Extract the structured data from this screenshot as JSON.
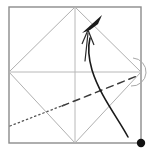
{
  "figure": {
    "kind": "origami-fold-diagram",
    "canvas": {
      "width": 150,
      "height": 154,
      "background": "#ffffff"
    }
  },
  "colors": {
    "frame": "#8c8c8c",
    "crease": "#b0b0b0",
    "crease_light": "#c4c4c4",
    "fold_line": "#3a3a3a",
    "arrow": "#1a1a1a",
    "dot": "#111111",
    "arc": "#a8a8a8"
  },
  "frame": {
    "name": "paper-square-border",
    "x": 9,
    "y": 7,
    "width": 132,
    "height": 136,
    "stroke_width": 1.4
  },
  "crease_lines": [
    {
      "name": "crease-vertical-center",
      "type": "mountain-existing",
      "points": "75,7 75,143",
      "stroke": "#b8b8b8",
      "stroke_width": 1
    },
    {
      "name": "crease-horizontal-center",
      "type": "mountain-existing",
      "points": "9,72 141,72",
      "stroke": "#b8b8b8",
      "stroke_width": 1
    },
    {
      "name": "crease-diamond-top-left",
      "type": "existing-fold",
      "points": "9,72 75,7",
      "stroke": "#b0b0b0",
      "stroke_width": 1
    },
    {
      "name": "crease-diamond-top-right",
      "type": "existing-fold",
      "points": "75,7 141,72",
      "stroke": "#b0b0b0",
      "stroke_width": 1
    },
    {
      "name": "crease-diamond-bottom-left",
      "type": "existing-fold",
      "points": "9,72 75,143",
      "stroke": "#b0b0b0",
      "stroke_width": 1
    },
    {
      "name": "crease-diamond-bottom-right",
      "type": "existing-fold",
      "points": "75,143 141,72",
      "stroke": "#b0b0b0",
      "stroke_width": 1
    }
  ],
  "fold_lines": [
    {
      "name": "valley-fold-dashed-line",
      "type": "valley-fold",
      "style": "dashed",
      "points": "62,106 137,76",
      "stroke": "#3a3a3a",
      "stroke_width": 1.5,
      "dash": "7 5"
    },
    {
      "name": "hidden-edge-dotted-line",
      "type": "hidden-edge",
      "style": "dotted",
      "points": "10,126 64,105",
      "stroke": "#555555",
      "stroke_width": 1.3,
      "dash": "1.4 3"
    }
  ],
  "arrows": [
    {
      "name": "fold-motion-curved-arrow",
      "type": "curved-fold-arrow",
      "path": "M 128,137 C 118,118 100,96 92,70 C 88,56 88,46 90,38",
      "stroke": "#1a1a1a",
      "stroke_width": 1.6,
      "head": {
        "name": "curved-arrow-solid-head",
        "points": "82,33 102,15 98,24 90,30",
        "fill": "#1a1a1a"
      }
    },
    {
      "name": "rotate-push-straight-arrow",
      "type": "straight-arrow",
      "path": "M 85,61 L 88,33",
      "stroke": "#2a2a2a",
      "stroke_width": 1.2,
      "head": {
        "name": "straight-arrow-open-head",
        "points": "82,44 88,30 94,45",
        "stroke": "#2a2a2a"
      }
    }
  ],
  "arc": {
    "name": "corner-rotation-arc",
    "path": "M 133,58 A 13 13 0 1 1 131,86",
    "stroke": "#a8a8a8",
    "stroke_width": 1
  },
  "markers": [
    {
      "name": "reference-point-dot",
      "type": "filled-circle",
      "cx": 141,
      "cy": 143,
      "r": 4.2,
      "fill": "#111111"
    }
  ]
}
